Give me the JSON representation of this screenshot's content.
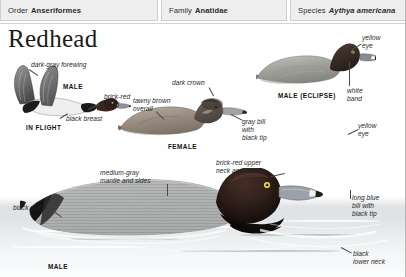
{
  "taxonomy": [
    {
      "rank": "Order",
      "name": "Anseriformes",
      "italic": false
    },
    {
      "rank": "Family",
      "name": "Anatidae",
      "italic": false
    },
    {
      "rank": "Species",
      "name": "Aythya americana",
      "italic": true
    }
  ],
  "title": "Redhead",
  "plates": {
    "in_flight": {
      "caption": "IN FLIGHT",
      "sex_label": "MALE",
      "annotations": {
        "forewing": "dark-gray forewing",
        "head": "brick-red\nhead",
        "breast": "black breast"
      }
    },
    "female": {
      "caption": "FEMALE",
      "annotations": {
        "crown": "dark crown",
        "body": "tawny brown\noverall",
        "bill": "gray bill\nwith\nblack tip"
      }
    },
    "male_eclipse": {
      "caption": "MALE (ECLIPSE)",
      "annotations": {
        "eye": "yellow\neye",
        "band": "white\nband"
      }
    },
    "male_swimming": {
      "caption": "MALE",
      "annotations": {
        "mantle": "medium-gray\nmantle and sides",
        "rump": "black rump",
        "neck_head": "brick-red upper\nneck and head",
        "eye": "yellow\neye",
        "bill": "long blue\nbill with\nblack tip",
        "lower_neck": "black\nlower neck"
      }
    }
  },
  "colors": {
    "header_panel": "#eeeeee",
    "header_border": "#cfcfcf",
    "text": "#1f1f1f",
    "leader": "#4a4a4a"
  }
}
